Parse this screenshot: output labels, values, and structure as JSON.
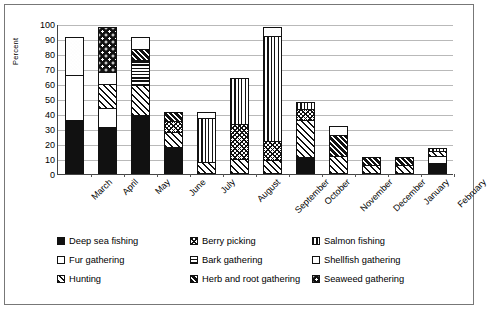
{
  "chart_data": {
    "type": "bar",
    "subtype": "stacked-bar",
    "title": "",
    "xlabel": "",
    "ylabel": "Percent",
    "ylim": [
      0,
      100
    ],
    "yticks": [
      100,
      90,
      80,
      70,
      60,
      50,
      40,
      30,
      20,
      10,
      0
    ],
    "grid": true,
    "legend_position": "bottom",
    "categories": [
      "March",
      "April",
      "May",
      "June",
      "July",
      "August",
      "September",
      "October",
      "November",
      "December",
      "January",
      "February"
    ],
    "series": [
      {
        "name": "Deep sea fishing",
        "key": "deep",
        "pattern": "solid-black",
        "values": [
          35,
          30,
          38,
          17,
          0,
          0,
          0,
          10,
          0,
          0,
          0,
          6
        ]
      },
      {
        "name": "Fur gathering",
        "key": "fur",
        "pattern": "white",
        "values": [
          30,
          13,
          0,
          0,
          0,
          0,
          0,
          0,
          0,
          0,
          0,
          5
        ]
      },
      {
        "name": "Hunting",
        "key": "hunt",
        "pattern": "diagonal-hatch",
        "values": [
          0,
          16,
          20,
          10,
          7,
          9,
          8,
          25,
          11,
          5,
          5,
          3
        ]
      },
      {
        "name": "Berry picking",
        "key": "berry",
        "pattern": "cross-dot",
        "values": [
          0,
          0,
          0,
          7,
          0,
          23,
          13,
          7,
          0,
          0,
          0,
          0
        ]
      },
      {
        "name": "Bark gathering",
        "key": "bark",
        "pattern": "horizontal-lines",
        "values": [
          0,
          0,
          17,
          0,
          0,
          0,
          0,
          0,
          0,
          0,
          0,
          0
        ]
      },
      {
        "name": "Herb and root gathering",
        "key": "herb",
        "pattern": "dark-hatch",
        "values": [
          0,
          0,
          7,
          6,
          0,
          0,
          0,
          0,
          14,
          5,
          5,
          0
        ]
      },
      {
        "name": "Salmon fishing",
        "key": "salmon",
        "pattern": "vertical-lines",
        "values": [
          0,
          0,
          0,
          0,
          29,
          31,
          70,
          5,
          0,
          0,
          0,
          2
        ]
      },
      {
        "name": "Shellfish gathering",
        "key": "shell",
        "pattern": "light-dots",
        "values": [
          25,
          8,
          8,
          0,
          4,
          0,
          6,
          0,
          6,
          0,
          0,
          0
        ]
      },
      {
        "name": "Seaweed gathering",
        "key": "seaweed",
        "pattern": "star-dark",
        "values": [
          0,
          30,
          0,
          0,
          0,
          0,
          0,
          0,
          0,
          0,
          0,
          0
        ]
      }
    ],
    "totals": [
      90,
      97,
      90,
      40,
      40,
      63,
      97,
      47,
      31,
      10,
      10,
      16
    ]
  },
  "legend": {
    "items": [
      {
        "label": "Deep sea fishing",
        "key": "deep"
      },
      {
        "label": "Berry picking",
        "key": "berry"
      },
      {
        "label": "Salmon fishing",
        "key": "salmon"
      },
      {
        "label": "Fur gathering",
        "key": "fur"
      },
      {
        "label": "Bark gathering",
        "key": "bark"
      },
      {
        "label": "Shellfish gathering",
        "key": "shell"
      },
      {
        "label": "Hunting",
        "key": "hunt"
      },
      {
        "label": "Herb and root gathering",
        "key": "herb"
      },
      {
        "label": "Seaweed gathering",
        "key": "seaweed"
      }
    ]
  }
}
